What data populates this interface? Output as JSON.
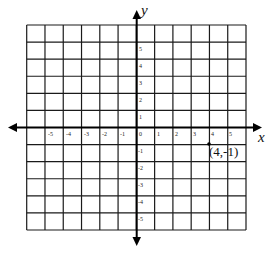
{
  "diagram": {
    "type": "coordinate-plane",
    "x_axis_label": "x",
    "y_axis_label": "y",
    "grid": {
      "columns": 12,
      "rows": 12,
      "line_color": "#1a1a1a"
    },
    "x_ticks": [
      "-5",
      "-4",
      "-3",
      "-2",
      "-1",
      "0",
      "1",
      "2",
      "3",
      "4",
      "5"
    ],
    "y_ticks_positive": [
      "5",
      "4",
      "3",
      "2",
      "1"
    ],
    "y_ticks_negative": [
      "-1",
      "-2",
      "-3",
      "-4",
      "-5"
    ],
    "point": {
      "x": 4,
      "y": -1,
      "label": "(4,-1)"
    }
  }
}
